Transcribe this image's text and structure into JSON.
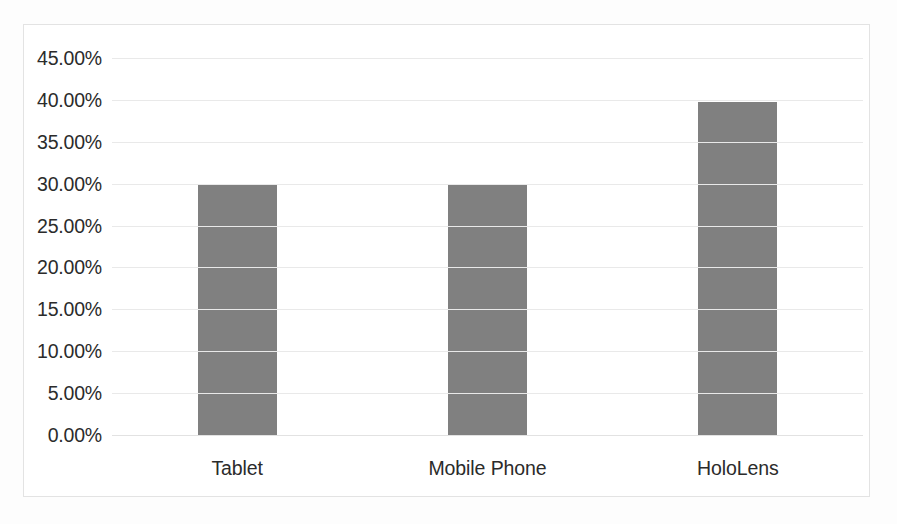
{
  "chart_data": {
    "type": "bar",
    "title": "",
    "subtitle": "",
    "xlabel": "",
    "ylabel": "",
    "categories": [
      "Tablet",
      "Mobile Phone",
      "HoloLens"
    ],
    "values": [
      0.3,
      0.298,
      0.397
    ],
    "value_labels": [
      "30.00%",
      "29.80%",
      "39.70%"
    ],
    "series": [
      {
        "name": "",
        "values": [
          0.3,
          0.298,
          0.397
        ],
        "color": "#808080"
      }
    ],
    "ylim": [
      0,
      0.45
    ],
    "ytick_values": [
      0.45,
      0.4,
      0.35,
      0.3,
      0.25,
      0.2,
      0.15,
      0.1,
      0.05,
      0.0
    ],
    "ytick_labels": [
      "45.00%",
      "40.00%",
      "35.00%",
      "30.00%",
      "25.00%",
      "20.00%",
      "15.00%",
      "10.00%",
      "5.00%",
      "0.00%"
    ],
    "grid": true,
    "grid_axis": "y",
    "legend": false,
    "legend_position": "none",
    "annotations": []
  },
  "colors": {
    "bar": "#808080",
    "gridline": "#e9e9e9",
    "axis": "#e2e2e2",
    "text": "#2b2b2b",
    "frame_border": "#e3e3e3",
    "plot_background": "#ffffff",
    "page_background": "#fdfdfd"
  }
}
